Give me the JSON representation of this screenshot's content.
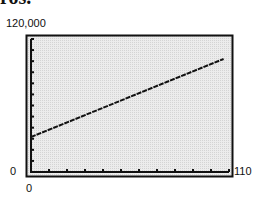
{
  "header": {
    "clipped_title_fragment": "ros."
  },
  "axes": {
    "y_max_label": "120,000",
    "y_min_label": "0",
    "x_min_label": "0",
    "x_max_label": "110"
  },
  "colors": {
    "plot_bg": "#e6e6e6",
    "frame": "#111111",
    "line": "#111111"
  },
  "chart_data": {
    "type": "line",
    "title": "",
    "xlabel": "",
    "ylabel": "",
    "xlim": [
      0,
      110
    ],
    "ylim": [
      0,
      120000
    ],
    "x_ticks_every": 10,
    "y_ticks_every": 10000,
    "grid": false,
    "legend": null,
    "series": [
      {
        "name": "line",
        "x": [
          0,
          107
        ],
        "y": [
          31600,
          102000
        ]
      }
    ],
    "style": "graphing-calculator window (dotted gray background, double frame)"
  }
}
